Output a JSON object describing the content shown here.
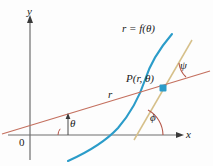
{
  "figure": {
    "background_color": "#fdfdfd",
    "axes": {
      "x_label": "x",
      "y_label": "y",
      "origin_label": "0",
      "axis_color": "#6e6e6e"
    },
    "labels": {
      "curve_equation": "r = f(θ)",
      "point": "P(r, θ)",
      "radius": "r",
      "angle_theta": "θ",
      "angle_phi": "ϕ",
      "angle_psi": "ψ"
    },
    "colors": {
      "curve": "#2b9cc9",
      "radial_line": "#c4705f",
      "tangent_line": "#d6c08a",
      "angle_arc": "#b5574a",
      "point_marker": "#2b9cc9",
      "axis": "#6e6e6e",
      "text": "#1a1a1a"
    },
    "geometry": {
      "origin": [
        30,
        135
      ],
      "point_P": [
        163,
        88
      ],
      "x_axis_end": [
        182,
        135
      ],
      "y_axis_top": [
        30,
        18
      ]
    }
  }
}
